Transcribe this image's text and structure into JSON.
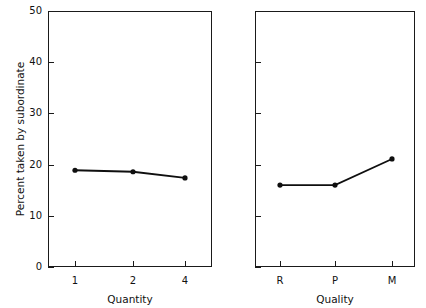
{
  "figure": {
    "background_color": "#ffffff",
    "ink_color": "#111111"
  },
  "chart_data": [
    {
      "type": "line",
      "panel": "left",
      "title": "",
      "xlabel": "Quantity",
      "ylabel": "Percent taken by subordinate",
      "categories": [
        "1",
        "2",
        "4"
      ],
      "x": [
        0,
        1,
        2
      ],
      "values": [
        18.9,
        18.6,
        17.4
      ],
      "ylim": [
        0,
        50
      ],
      "yticks": [
        0,
        10,
        20,
        30,
        40,
        50
      ],
      "yticklabels": [
        "0",
        "10",
        "20",
        "30",
        "40",
        "50"
      ],
      "xticklabels": [
        "1",
        "2",
        "4"
      ],
      "grid": false,
      "legend": false,
      "marker": "filled-circle",
      "line_color": "#0f0f0f"
    },
    {
      "type": "line",
      "panel": "right",
      "title": "",
      "xlabel": "Quality",
      "ylabel": "",
      "categories": [
        "R",
        "P",
        "M"
      ],
      "x": [
        0,
        1,
        2
      ],
      "values": [
        16.0,
        16.0,
        21.1
      ],
      "ylim": [
        0,
        50
      ],
      "yticks": [
        0,
        10,
        20,
        30,
        40,
        50
      ],
      "yticklabels": [
        "",
        "",
        "",
        "",
        "",
        ""
      ],
      "xticklabels": [
        "R",
        "P",
        "M"
      ],
      "grid": false,
      "legend": false,
      "marker": "filled-circle",
      "line_color": "#0f0f0f"
    }
  ],
  "left_panel": {
    "y_axis": {
      "label": "Percent taken by subordinate",
      "ticks": [
        {
          "value": 50,
          "label": "50"
        },
        {
          "value": 40,
          "label": "40"
        },
        {
          "value": 30,
          "label": "30"
        },
        {
          "value": 20,
          "label": "20"
        },
        {
          "value": 10,
          "label": "10"
        },
        {
          "value": 0,
          "label": "0"
        }
      ]
    },
    "x_axis": {
      "label": "Quantity",
      "ticks": [
        {
          "label": "1"
        },
        {
          "label": "2"
        },
        {
          "label": "4"
        }
      ]
    },
    "series": {
      "points": [
        {
          "x_label": "1",
          "value": 18.9
        },
        {
          "x_label": "2",
          "value": 18.6
        },
        {
          "x_label": "4",
          "value": 17.4
        }
      ]
    }
  },
  "right_panel": {
    "y_axis": {
      "label": "",
      "ticks": [
        {
          "value": 50,
          "label": ""
        },
        {
          "value": 40,
          "label": ""
        },
        {
          "value": 30,
          "label": ""
        },
        {
          "value": 20,
          "label": ""
        },
        {
          "value": 10,
          "label": ""
        },
        {
          "value": 0,
          "label": ""
        }
      ]
    },
    "x_axis": {
      "label": "Quality",
      "ticks": [
        {
          "label": "R"
        },
        {
          "label": "P"
        },
        {
          "label": "M"
        }
      ]
    },
    "series": {
      "points": [
        {
          "x_label": "R",
          "value": 16.0
        },
        {
          "x_label": "P",
          "value": 16.0
        },
        {
          "x_label": "M",
          "value": 21.1
        }
      ]
    }
  }
}
